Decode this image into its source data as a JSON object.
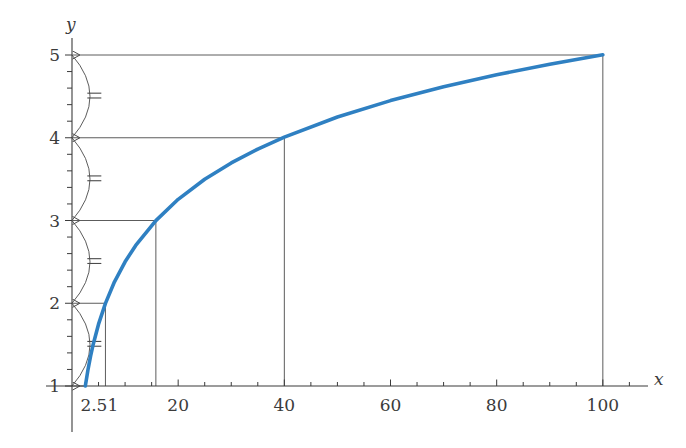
{
  "figure": {
    "background": "#ffffff",
    "axis_color": "#3b3b3b",
    "curve_color": "#2f80c2",
    "guide_color": "#4a4a4a"
  },
  "axes": {
    "x_name": "x",
    "y_name": "y"
  },
  "chart_data": {
    "type": "line",
    "title": "",
    "subtitle": "",
    "xlabel": "x",
    "ylabel": "y",
    "xlim": [
      0,
      107
    ],
    "ylim": [
      0.78,
      5.25
    ],
    "grid": false,
    "legend": null,
    "function": "y = log_2.51(x)",
    "log_base": 2.51,
    "x_ticks": [
      2.51,
      20,
      40,
      60,
      80,
      100
    ],
    "x_tick_labels": [
      "2.51",
      "20",
      "40",
      "60",
      "80",
      "100"
    ],
    "x_minor_step": 5,
    "y_ticks": [
      1,
      2,
      3,
      4,
      5
    ],
    "y_tick_labels": [
      "1",
      "2",
      "3",
      "4",
      "5"
    ],
    "y_minor_per_interval": 4,
    "series": [
      {
        "name": "log curve",
        "color": "#2f80c2",
        "x": [
          2.51,
          3,
          3.5,
          4,
          5,
          6.3,
          8,
          10,
          12,
          15.8,
          20,
          25,
          30,
          35,
          40,
          50,
          60,
          70,
          80,
          90,
          100
        ],
        "y": [
          1.0,
          1.193,
          1.36,
          1.505,
          1.747,
          1.999,
          2.259,
          2.501,
          2.699,
          2.999,
          3.256,
          3.498,
          3.696,
          3.863,
          4.008,
          4.251,
          4.449,
          4.616,
          4.761,
          4.889,
          5.003
        ]
      }
    ],
    "marked_points": [
      {
        "label": "(2.51, 1)",
        "x": 2.51,
        "y": 1
      },
      {
        "label": "(6.3, 2)",
        "x": 6.3,
        "y": 2
      },
      {
        "label": "(15.8, 3)",
        "x": 15.8,
        "y": 3
      },
      {
        "label": "(40, 4)",
        "x": 40,
        "y": 4
      },
      {
        "label": "(100, 5)",
        "x": 100,
        "y": 5
      }
    ],
    "annotations": [
      {
        "type": "brace",
        "from_y": 1,
        "to_y": 2,
        "mark": "double-tick"
      },
      {
        "type": "brace",
        "from_y": 2,
        "to_y": 3,
        "mark": "double-tick"
      },
      {
        "type": "brace",
        "from_y": 3,
        "to_y": 4,
        "mark": "double-tick"
      },
      {
        "type": "brace",
        "from_y": 4,
        "to_y": 5,
        "mark": "double-tick"
      }
    ]
  }
}
